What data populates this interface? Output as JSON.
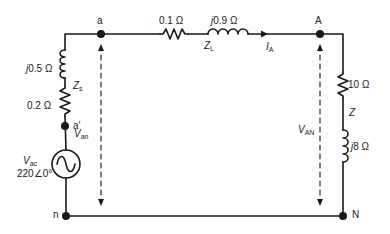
{
  "nodes": {
    "a": "a",
    "a_prime": "a′",
    "n": "n",
    "A": "A",
    "N": "N"
  },
  "source_impedance": {
    "name": "Z",
    "name_sub": "s",
    "reactance_j": "j",
    "reactance": "0.5 Ω",
    "resistance": "0.2 Ω"
  },
  "line_impedance": {
    "name": "Z",
    "name_sub": "L",
    "resistance": "0.1 Ω",
    "reactance_j": "j",
    "reactance": "0.9 Ω"
  },
  "load_impedance": {
    "name": "Z",
    "resistance": "10 Ω",
    "reactance_j": "j",
    "reactance": "8 Ω"
  },
  "source": {
    "symbol": "V",
    "symbol_sub": "ac",
    "value": "220∠0°"
  },
  "current": {
    "symbol": "I",
    "symbol_sub": "A"
  },
  "voltages": {
    "source_side": {
      "symbol": "V",
      "sub": "an"
    },
    "load_side": {
      "symbol": "V",
      "sub": "AN"
    }
  },
  "colors": {
    "wire": "#1a1a1a",
    "text": "#222222",
    "background": "#ffffff"
  }
}
